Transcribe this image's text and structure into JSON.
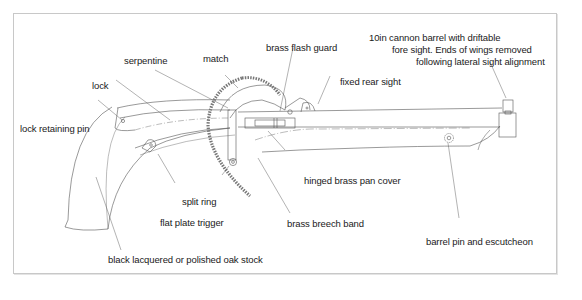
{
  "diagram": {
    "type": "technical-line-drawing",
    "colors": {
      "line": "#555555",
      "text": "#1a1a1a",
      "frame": "#c8c8c8",
      "background": "#ffffff"
    },
    "labels": {
      "serpentine": "serpentine",
      "match": "match",
      "brass_flash_guard": "brass flash guard",
      "barrel_note_line1": "10in cannon barrel with driftable",
      "barrel_note_line2": "fore sight.  Ends of wings removed",
      "barrel_note_line3": "following lateral sight alignment",
      "fixed_rear_sight": "fixed rear sight",
      "lock": "lock",
      "lock_retaining_pin": "lock retaining pin",
      "hinged_brass_pan_cover": "hinged brass pan cover",
      "split_ring": "split ring",
      "flat_plate_trigger": "flat plate trigger",
      "brass_breech_band": "brass breech band",
      "barrel_pin_and_escutcheon": "barrel pin and escutcheon",
      "stock": "black lacquered or polished oak stock"
    }
  }
}
